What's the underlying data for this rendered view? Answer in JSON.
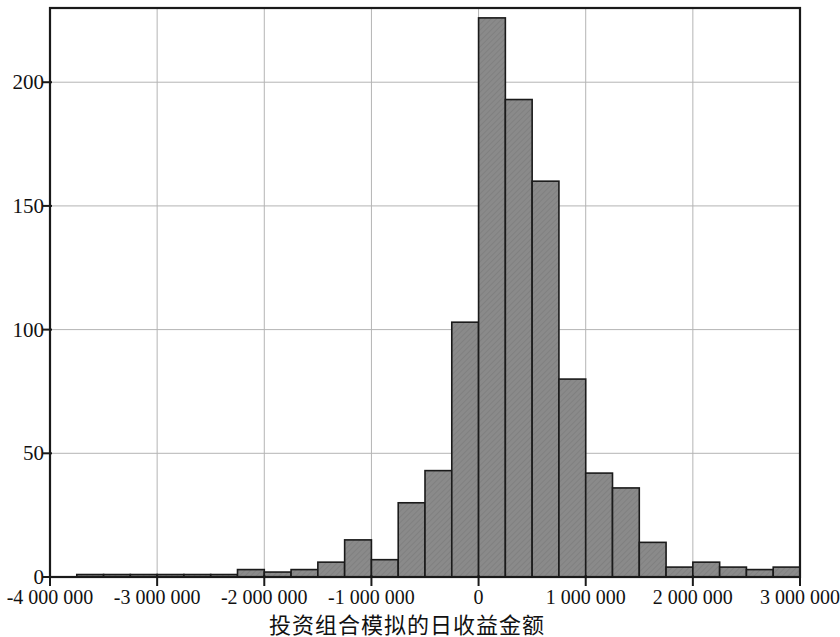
{
  "chart_data": {
    "type": "bar",
    "title": "",
    "subtitle": "",
    "xlabel": "投资组合模拟的日收益金额",
    "ylabel": "",
    "xlim": [
      -4000000,
      3000000
    ],
    "ylim": [
      0,
      230
    ],
    "grid": true,
    "legend": null,
    "bin_width": 250000,
    "x_ticks": [
      -4000000,
      -3000000,
      -2000000,
      -1000000,
      0,
      1000000,
      2000000,
      3000000
    ],
    "x_tick_labels": [
      "-4 000 000",
      "-3 000 000",
      "-2 000 000",
      "-1 000 000",
      "0",
      "1 000 000",
      "2 000 000",
      "3 000 000"
    ],
    "y_ticks": [
      0,
      50,
      100,
      150,
      200
    ],
    "y_tick_labels": [
      "0",
      "50",
      "100",
      "150",
      "200"
    ],
    "x_gridlines": [
      -3000000,
      -2000000,
      -1000000,
      0,
      1000000,
      2000000,
      3000000
    ],
    "y_gridlines": [
      50,
      100,
      150,
      200
    ],
    "bin_starts": [
      -4000000,
      -3750000,
      -3500000,
      -3250000,
      -3000000,
      -2750000,
      -2500000,
      -2250000,
      -2000000,
      -1750000,
      -1500000,
      -1250000,
      -1000000,
      -750000,
      -500000,
      -250000,
      0,
      250000,
      500000,
      750000,
      1000000,
      1250000,
      1500000,
      1750000,
      2000000,
      2250000,
      2500000,
      2750000
    ],
    "values": [
      0,
      1,
      1,
      1,
      1,
      1,
      1,
      3,
      2,
      3,
      6,
      15,
      7,
      30,
      43,
      103,
      226,
      193,
      160,
      80,
      42,
      36,
      14,
      4,
      6,
      4,
      3,
      4
    ],
    "bar_fill_color": "#8a8a8a",
    "bar_edge_color": "#1a1a1a",
    "axis_color": "#1a1a1a",
    "grid_color": "#b4b4b4",
    "background_color": "#ffffff"
  }
}
